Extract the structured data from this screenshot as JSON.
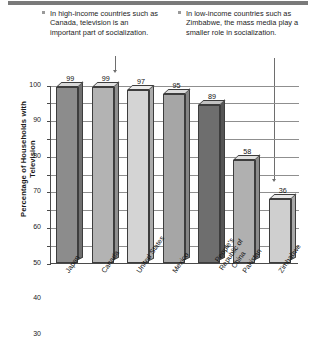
{
  "annotations": {
    "left": {
      "bullet": "square-bullet",
      "text": "In high-income countries such as Canada, television is an important part of socialization."
    },
    "right": {
      "bullet": "square-bullet",
      "text": "In low-income countries such as Zimbabwe, the mass media play a smaller role in socialization."
    }
  },
  "chart_data": {
    "type": "bar",
    "title": "",
    "subtitle": "",
    "xlabel": "",
    "ylabel": "Percentage of Households with Television",
    "ylim": [
      0,
      100
    ],
    "yticks": [
      0,
      10,
      20,
      30,
      40,
      50,
      60,
      70,
      80,
      90,
      100
    ],
    "ytick_labels": [
      "0",
      "10",
      "20",
      "30",
      "40",
      "50",
      "60",
      "70",
      "80",
      "90",
      "100"
    ],
    "grid": true,
    "grid_axis": "y",
    "legend": false,
    "legend_position": "none",
    "style": "3d-bars",
    "categories": [
      "Japan",
      "Canada",
      "United States",
      "Mexico",
      "People's Republic of China",
      "Pakistan",
      "Zimbabwe"
    ],
    "values": [
      99,
      99,
      97,
      95,
      89,
      58,
      36
    ],
    "value_labels": [
      "99",
      "99",
      "97",
      "95",
      "89",
      "58",
      "36"
    ],
    "bar_colors": [
      "#8c8c8c",
      "#b3b3b3",
      "#d4d4d4",
      "#a6a6a6",
      "#6e6e6e",
      "#b0b0b0",
      "#cfcfcf"
    ],
    "bar_top_colors": [
      "#d8d8d8",
      "#e2e2e2",
      "#ececec",
      "#dcdcdc",
      "#c2c2c2",
      "#e0e0e0",
      "#e8e8e8"
    ],
    "bar_side_colors": [
      "#6f6f6f",
      "#8f8f8f",
      "#ababab",
      "#858585",
      "#555555",
      "#8c8c8c",
      "#a8a8a8"
    ],
    "annotation_targets": [
      "Canada",
      "Zimbabwe"
    ]
  },
  "colors": {
    "header_bar": "#7a7a7a",
    "axis": "#4a4a4a",
    "grid": "#8f8f8f",
    "text": "#1a1a1a"
  }
}
